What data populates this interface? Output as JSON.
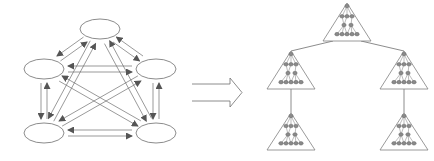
{
  "diagram": {
    "colors": {
      "background": "#ffffff",
      "stroke": "#6e6e6e",
      "arrow_fill": "#555555",
      "node_fill": "#8a8a8a",
      "node_stroke": "#555555",
      "triangle_stroke": "#808080"
    },
    "left_network": {
      "nodes": [
        {
          "id": "top",
          "cx": 100,
          "cy": 29,
          "rx": 20,
          "ry": 10
        },
        {
          "id": "mid-left",
          "cx": 44,
          "cy": 69,
          "rx": 20,
          "ry": 10
        },
        {
          "id": "mid-right",
          "cx": 156,
          "cy": 69,
          "rx": 20,
          "ry": 10
        },
        {
          "id": "bottom-left",
          "cx": 44,
          "cy": 133,
          "rx": 20,
          "ry": 10
        },
        {
          "id": "bottom-right",
          "cx": 156,
          "cy": 133,
          "rx": 20,
          "ry": 10
        }
      ],
      "edges": "bidirectional between every pair of nodes (complete graph, 10 pairs, 20 arrows)"
    },
    "transform_arrow": {
      "type": "hollow-double-line-arrow",
      "x1": 192,
      "x2": 242,
      "y_top": 84,
      "y_bottom": 101
    },
    "right_tree": {
      "subtrees": [
        {
          "id": "root",
          "apex_x": 347,
          "apex_y": 3,
          "base_y": 41,
          "half_width": 24
        },
        {
          "id": "left",
          "apex_x": 291,
          "apex_y": 51,
          "base_y": 89,
          "half_width": 24
        },
        {
          "id": "right",
          "apex_x": 404,
          "apex_y": 51,
          "base_y": 89,
          "half_width": 24
        },
        {
          "id": "left-child",
          "apex_x": 291,
          "apex_y": 113,
          "base_y": 150,
          "half_width": 24
        },
        {
          "id": "right-child",
          "apex_x": 404,
          "apex_y": 113,
          "base_y": 150,
          "half_width": 24
        }
      ],
      "links": [
        {
          "from": "root",
          "to": "left"
        },
        {
          "from": "root",
          "to": "right"
        },
        {
          "from": "left",
          "to": "left-child"
        },
        {
          "from": "right",
          "to": "right-child"
        }
      ]
    }
  }
}
